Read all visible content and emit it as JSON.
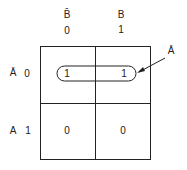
{
  "diagram": {
    "type": "karnaugh-map",
    "variables": [
      "A",
      "B"
    ],
    "columns": [
      {
        "var_label": "B̄",
        "value_label": "0"
      },
      {
        "var_label": "B",
        "value_label": "1"
      }
    ],
    "rows": [
      {
        "var_label": "Ā",
        "value_label": "0",
        "cells": [
          "1",
          "1"
        ]
      },
      {
        "var_label": "A",
        "value_label": "1",
        "cells": [
          "0",
          "0"
        ]
      }
    ],
    "grouping": {
      "label": "Ā",
      "covers": "row 0 (both cells)"
    }
  }
}
